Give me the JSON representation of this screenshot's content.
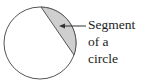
{
  "diagram": {
    "label_lines": [
      "Segment",
      "of a",
      "circle"
    ],
    "colors": {
      "stroke": "#555555",
      "segment_fill": "#cfcfcf",
      "text": "#222222"
    }
  }
}
